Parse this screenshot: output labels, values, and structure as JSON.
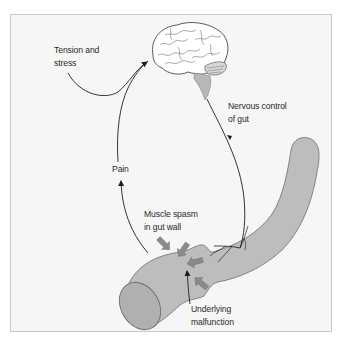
{
  "diagram": {
    "type": "brain-gut feedback loop",
    "colors": {
      "frame_bg": "#f6f6f6",
      "frame_border": "#c9c9c9",
      "gut_fill": "#bdbdbd",
      "gut_stroke": "#6e6e6e",
      "arrow_fill": "#8a8a8a",
      "line": "#1e1e1e"
    },
    "labels": {
      "tension": {
        "line1": "Tension and",
        "line2": "stress"
      },
      "nervous": {
        "line1": "Nervous control",
        "line2": "of gut"
      },
      "pain": {
        "line1": "Pain"
      },
      "spasm": {
        "line1": "Muscle spasm",
        "line2": "in gut wall"
      },
      "malfunction": {
        "line1": "Underlying",
        "line2": "malfunction"
      }
    },
    "elements": [
      "brain",
      "nerve-pathway",
      "gut-tube",
      "spasm-arrows",
      "pain-arrow",
      "tension-arrow"
    ]
  }
}
